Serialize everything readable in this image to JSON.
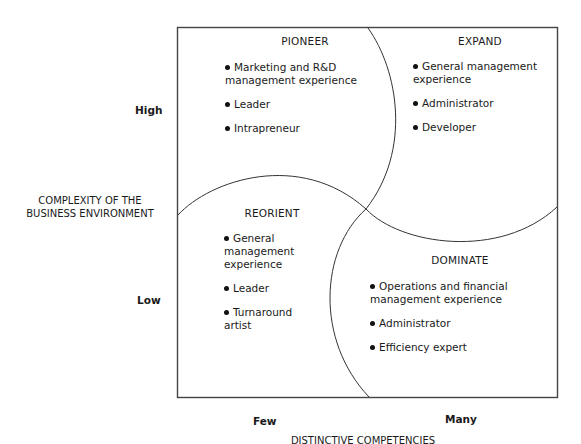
{
  "diagram": {
    "type": "2x2 matrix with overlapping arcs",
    "y_axis": {
      "title_line1": "COMPLEXITY OF THE",
      "title_line2": "BUSINESS ENVIRONMENT",
      "high_label": "High",
      "low_label": "Low"
    },
    "x_axis": {
      "title": "DISTINCTIVE COMPETENCIES",
      "few_label": "Few",
      "many_label": "Many"
    },
    "quadrants": {
      "pioneer": {
        "title": "PIONEER",
        "items": [
          {
            "line1": "Marketing and R&D",
            "line2": "management experience"
          },
          {
            "line1": "Leader"
          },
          {
            "line1": "Intrapreneur"
          }
        ]
      },
      "expand": {
        "title": "EXPAND",
        "items": [
          {
            "line1": "General management",
            "line2": "experience"
          },
          {
            "line1": "Administrator"
          },
          {
            "line1": "Developer"
          }
        ]
      },
      "reorient": {
        "title": "REORIENT",
        "items": [
          {
            "line1": "General",
            "line2": "management",
            "line3": "experience"
          },
          {
            "line1": "Leader"
          },
          {
            "line1": "Turnaround",
            "line2": "artist"
          }
        ]
      },
      "dominate": {
        "title": "DOMINATE",
        "items": [
          {
            "line1": "Operations and financial",
            "line2": "management experience"
          },
          {
            "line1": "Administrator"
          },
          {
            "line1": "Efficiency expert"
          }
        ]
      }
    },
    "colors": {
      "line": "#333333",
      "text": "#1a1a1a",
      "background": "#ffffff"
    }
  }
}
